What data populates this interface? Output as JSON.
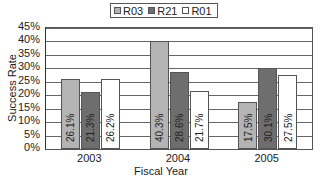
{
  "chart_data": {
    "type": "bar",
    "title": "",
    "xlabel": "Fiscal Year",
    "ylabel": "Success Rate",
    "categories": [
      "2003",
      "2004",
      "2005"
    ],
    "series": [
      {
        "name": "R03",
        "values": [
          26.1,
          40.3,
          17.5
        ],
        "labels": [
          "26.1%",
          "40.3%",
          "17.5%"
        ],
        "color": "#b4b4b4"
      },
      {
        "name": "R21",
        "values": [
          21.3,
          28.6,
          30.1
        ],
        "labels": [
          "21.3%",
          "28.6%",
          "30.1%"
        ],
        "color": "#6e6e6e"
      },
      {
        "name": "R01",
        "values": [
          26.2,
          21.7,
          27.5
        ],
        "labels": [
          "26.2%",
          "21.7%",
          "27.5%"
        ],
        "color": "#ffffff"
      }
    ],
    "ylim": [
      0,
      45
    ],
    "yticks": [
      "0%",
      "5%",
      "10%",
      "15%",
      "20%",
      "25%",
      "30%",
      "35%",
      "40%",
      "45%"
    ],
    "grid": true,
    "legend_position": "top"
  }
}
